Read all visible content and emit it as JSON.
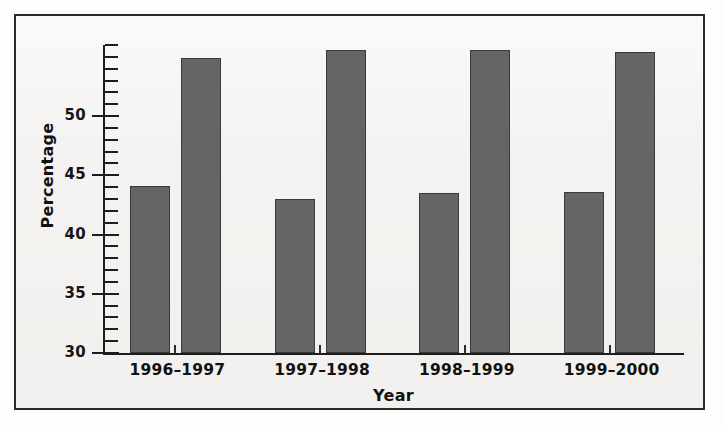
{
  "chart_data": {
    "type": "bar",
    "title": "",
    "subtitle": "",
    "xlabel": "Year",
    "ylabel": "Percentage",
    "categories": [
      "1996–1997",
      "1997–1998",
      "1998–1999",
      "1999–2000"
    ],
    "series": [
      {
        "name": "Series 1",
        "values": [
          44.1,
          43.0,
          43.5,
          43.6
        ],
        "color": "#666565"
      },
      {
        "name": "Series 2",
        "values": [
          54.9,
          55.6,
          55.6,
          55.4
        ],
        "color": "#666565"
      }
    ],
    "ylim": [
      30,
      56
    ],
    "ytick_labels": [
      "30",
      "35",
      "40",
      "45",
      "50"
    ],
    "ytick_values": [
      30,
      35,
      40,
      45,
      50
    ],
    "minor_tick_step": 1,
    "grid": false,
    "legend": "none",
    "axis_top_value": 56
  },
  "axes": {
    "y_title": "Percentage",
    "x_title": "Year"
  },
  "ticks": {
    "y_labels": [
      "50",
      "45",
      "40",
      "35",
      "30"
    ]
  },
  "x_labels": [
    "1996–1997",
    "1997–1998",
    "1998–1999",
    "1999–2000"
  ],
  "colors": {
    "bar_fill": "#666565",
    "bar_edge": "#3a3a3a",
    "axis": "#1d1d1d",
    "frame": "#2b2b2b",
    "background": "#f4f3f1",
    "text": "#121212"
  }
}
